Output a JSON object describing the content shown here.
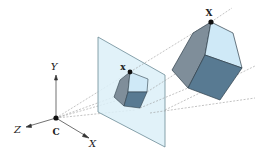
{
  "diagram": {
    "labels": {
      "camera_center": "C",
      "axis_x": "X",
      "axis_y": "Y",
      "axis_z": "Z",
      "image_point": "x",
      "world_point": "X"
    },
    "colors": {
      "plane_fill": "#dcf0f8",
      "plane_stroke": "#6b8a96",
      "cube_light": "#cfe9f7",
      "cube_mid": "#7f8e9a",
      "cube_dark": "#587a92",
      "ray": "#9a9a9a",
      "axis": "#333333",
      "point": "#111111"
    }
  }
}
